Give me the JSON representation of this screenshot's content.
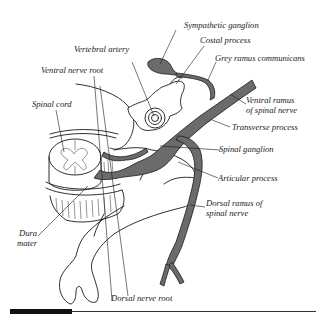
{
  "figure": {
    "type": "anatomical-diagram"
  },
  "labels": {
    "sympathetic_ganglion": "Sympathetic ganglion",
    "costal_process": "Costal process",
    "grey_ramus": "Grey ramus communicans",
    "vertebral_artery": "Vertebral artery",
    "ventral_nerve_root": "Ventral nerve root",
    "spinal_cord": "Spinal cord",
    "ventral_ramus_1": "Ventral ramus",
    "ventral_ramus_2": "of spinal nerve",
    "transverse_process": "Transverse process",
    "spinal_ganglion": "Spinal ganglion",
    "articular_process": "Articular process",
    "dorsal_ramus_1": "Dorsal ramus of",
    "dorsal_ramus_2": "spinal nerve",
    "dura_1": "Dura",
    "dura_2": "mater",
    "dorsal_nerve_root": "Dorsal nerve root"
  },
  "colors": {
    "nerve_fill": "#6b6b6b",
    "line": "#1a1a1a",
    "background": "#ffffff"
  }
}
